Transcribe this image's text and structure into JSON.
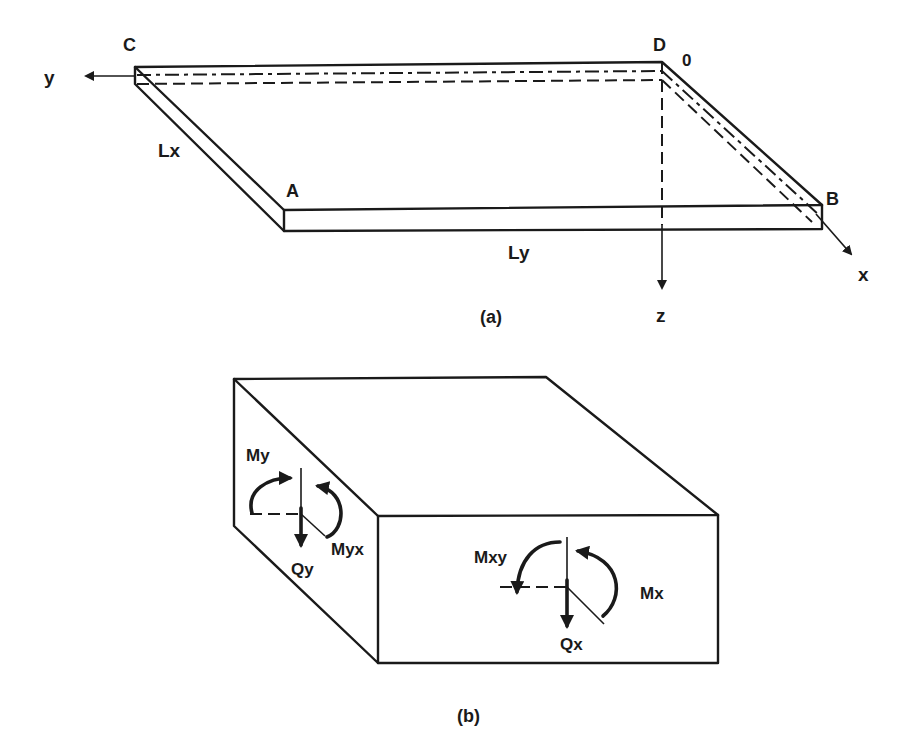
{
  "figure": {
    "panel_a": {
      "caption": "(a)",
      "corners": {
        "A": "A",
        "B": "B",
        "C": "C",
        "D": "D"
      },
      "origin": "0",
      "axes": {
        "x": "x",
        "y": "y",
        "z": "z"
      },
      "dimensions": {
        "Lx": "Lx",
        "Ly": "Ly"
      }
    },
    "panel_b": {
      "caption": "(b)",
      "side_face": {
        "moment_y": "My",
        "twist_yx": "Myx",
        "shear_y": "Qy"
      },
      "front_face": {
        "twist_xy": "Mxy",
        "moment_x": "Mx",
        "shear_x": "Qx"
      }
    },
    "colors": {
      "ink": "#1a1a1a",
      "background": "#ffffff"
    }
  }
}
